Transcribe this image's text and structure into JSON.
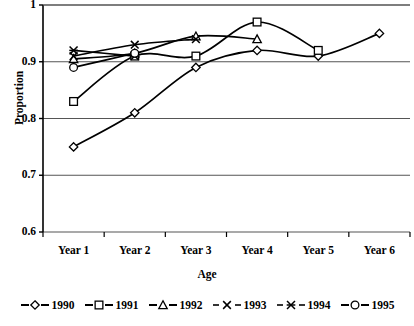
{
  "chart_data": {
    "type": "line",
    "title": "",
    "xlabel": "Age",
    "ylabel": "Proportion",
    "categories": [
      "Year 1",
      "Year 2",
      "Year 3",
      "Year 4",
      "Year 5",
      "Year 6"
    ],
    "ylim": [
      0.6,
      1.0
    ],
    "yticks": [
      "0.6",
      "0.7",
      "0.8",
      "0.9",
      "1"
    ],
    "ytick_values": [
      0.6,
      0.7,
      0.8,
      0.9,
      1.0
    ],
    "grid": "horizontal",
    "legend_position": "bottom",
    "series": [
      {
        "name": "1990",
        "marker": "diamond",
        "values": [
          0.75,
          0.81,
          0.89,
          0.92,
          0.91,
          0.95
        ]
      },
      {
        "name": "1991",
        "marker": "square",
        "values": [
          0.83,
          0.91,
          0.91,
          0.97,
          0.92,
          null
        ]
      },
      {
        "name": "1992",
        "marker": "triangle",
        "values": [
          0.905,
          0.915,
          0.945,
          0.94,
          null,
          null
        ]
      },
      {
        "name": "1993",
        "marker": "cross-x",
        "values": [
          0.91,
          0.93,
          0.94,
          null,
          null,
          null
        ]
      },
      {
        "name": "1994",
        "marker": "asterisk",
        "values": [
          0.92,
          0.91,
          null,
          null,
          null,
          null
        ]
      },
      {
        "name": "1995",
        "marker": "circle",
        "values": [
          0.89,
          0.915,
          null,
          null,
          null,
          null
        ]
      }
    ]
  },
  "axes": {
    "y_title": "Proportion",
    "x_title": "Age",
    "y_labels": [
      "1",
      "0.9",
      "0.8",
      "0.7",
      "0.6"
    ],
    "x_labels": [
      "Year 1",
      "Year 2",
      "Year 3",
      "Year 4",
      "Year 5",
      "Year 6"
    ]
  },
  "legend": {
    "items": [
      {
        "label": "1990",
        "marker": "diamond"
      },
      {
        "label": "1991",
        "marker": "square"
      },
      {
        "label": "1992",
        "marker": "triangle"
      },
      {
        "label": "1993",
        "marker": "cross-x"
      },
      {
        "label": "1994",
        "marker": "asterisk"
      },
      {
        "label": "1995",
        "marker": "circle"
      }
    ]
  },
  "colors": {
    "line": "#000000",
    "grid": "#555555",
    "axis": "#000000",
    "background": "#ffffff",
    "marker_fill": "#ffffff"
  }
}
